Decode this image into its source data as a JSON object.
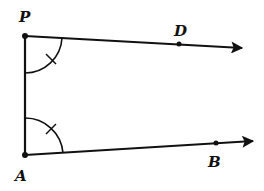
{
  "diagram": {
    "type": "geometry",
    "points": {
      "P": {
        "label": "P",
        "x": 25,
        "y": 36
      },
      "A": {
        "label": "A",
        "x": 25,
        "y": 155
      },
      "D": {
        "label": "D",
        "x": 179,
        "y": 44
      },
      "B": {
        "label": "B",
        "x": 216,
        "y": 143
      }
    },
    "segments": [
      {
        "from": "P",
        "to": "A"
      }
    ],
    "rays": [
      {
        "from": "P",
        "through": "D"
      },
      {
        "from": "A",
        "through": "B"
      }
    ],
    "angle_marks": [
      {
        "vertex": "P",
        "between": [
          "A",
          "D"
        ],
        "marker": "single tick"
      },
      {
        "vertex": "A",
        "between": [
          "P",
          "B"
        ],
        "marker": "single tick"
      }
    ],
    "colors": {
      "stroke": "#111111",
      "background": "#ffffff"
    }
  }
}
